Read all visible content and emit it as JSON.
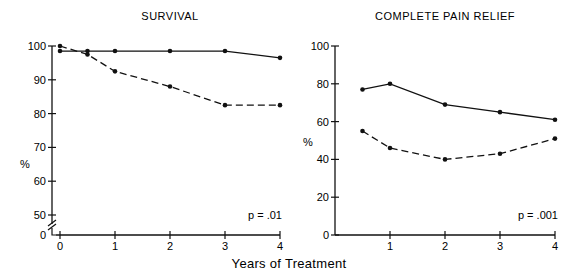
{
  "figure": {
    "xlabel": "Years of Treatment"
  },
  "chart_data": [
    {
      "type": "line",
      "title": "SURVIVAL",
      "xlabel": "Years of Treatment",
      "ylabel": "%",
      "x_ticks": [
        0,
        1,
        2,
        3,
        4
      ],
      "y_ticks": [
        0,
        50,
        60,
        70,
        80,
        90,
        100
      ],
      "ylim": [
        50,
        100
      ],
      "axis_break": true,
      "annotation": "p = .01",
      "series": [
        {
          "name": "solid",
          "style": "solid",
          "x": [
            0,
            0.5,
            1,
            2,
            3,
            4
          ],
          "values": [
            98.5,
            98.5,
            98.5,
            98.5,
            98.5,
            96.5
          ]
        },
        {
          "name": "dashed",
          "style": "dashed",
          "x": [
            0,
            0.5,
            1,
            2,
            3,
            4
          ],
          "values": [
            100,
            97.5,
            92.5,
            88,
            82.5,
            82.5
          ]
        }
      ]
    },
    {
      "type": "line",
      "title": "COMPLETE PAIN RELIEF",
      "xlabel": "Years of Treatment",
      "ylabel": "%",
      "x_ticks": [
        1,
        2,
        3,
        4
      ],
      "y_ticks": [
        0,
        20,
        40,
        60,
        80,
        100
      ],
      "ylim": [
        0,
        100
      ],
      "annotation": "p = .001",
      "series": [
        {
          "name": "solid",
          "style": "solid",
          "x": [
            0.5,
            1,
            2,
            3,
            4
          ],
          "values": [
            77,
            80,
            69,
            65,
            61
          ]
        },
        {
          "name": "dashed",
          "style": "dashed",
          "x": [
            0.5,
            1,
            2,
            3,
            4
          ],
          "values": [
            55,
            46,
            40,
            43,
            51
          ]
        }
      ]
    }
  ]
}
